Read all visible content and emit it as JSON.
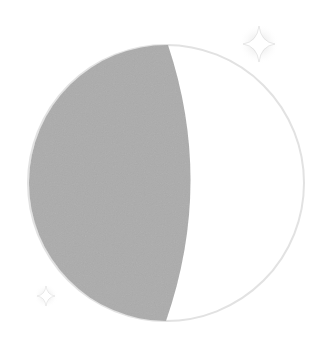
{
  "scene": {
    "title": "Waxing gibbous moon illustration",
    "subject": "moon",
    "phase": "gibbous",
    "lit_side": "right",
    "shadow_side": "left"
  },
  "colors": {
    "background": "#ffffff",
    "moon_lit": "#ffffff",
    "moon_shadow": "#acacac",
    "moon_outline": "#e0e0e0",
    "sparkle": "#ffffff",
    "sparkle_glow": "#cfcfcf"
  },
  "moon": {
    "cx": 166,
    "cy": 183,
    "r": 138,
    "terminator_mid_x": 196
  },
  "sparkles": [
    {
      "name": "sparkle-large",
      "cx": 259,
      "cy": 44,
      "size": 16
    },
    {
      "name": "sparkle-small",
      "cx": 46,
      "cy": 296,
      "size": 9
    }
  ]
}
